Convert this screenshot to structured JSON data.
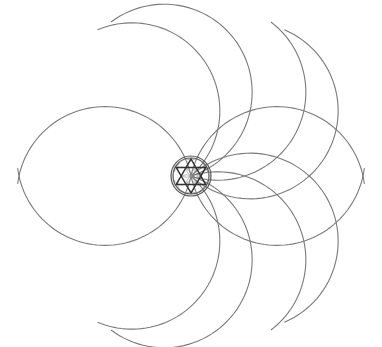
{
  "diagram": {
    "title": "",
    "type": "geometric-rosette",
    "center": [
      191,
      176
    ],
    "petal_count": 6,
    "petal_length": 172,
    "petal_arc_radius": 88,
    "petal_angles_deg": [
      0,
      60,
      120,
      180,
      240,
      300
    ],
    "inner_circle_radii": [
      20,
      18
    ],
    "hexagram_radius": 17,
    "stroke_color": "#7a7a7a",
    "inner_stroke_color": "#333333",
    "background": "#ffffff"
  }
}
